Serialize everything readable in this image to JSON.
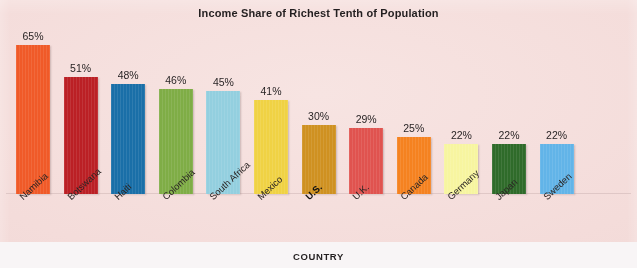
{
  "chart_data": {
    "type": "bar",
    "title": "Income Share of Richest Tenth of Population",
    "xlabel": "COUNTRY",
    "ylabel": "",
    "ylim": [
      0,
      70
    ],
    "grid": false,
    "legend": "none",
    "categories": [
      "Namibia",
      "Botswana",
      "Haiti",
      "Colombia",
      "South Africa",
      "Mexico",
      "U.S.",
      "U.K.",
      "Canada",
      "Germany",
      "Japan",
      "Sweden"
    ],
    "values": [
      65,
      51,
      48,
      46,
      45,
      41,
      30,
      29,
      25,
      22,
      22,
      22
    ],
    "value_labels": [
      "65%",
      "51%",
      "48%",
      "46%",
      "45%",
      "41%",
      "30%",
      "29%",
      "25%",
      "22%",
      "22%",
      "22%"
    ],
    "bar_colors": [
      "#f05a28",
      "#bb2025",
      "#1a6fa8",
      "#7fad46",
      "#93cfdf",
      "#f0d244",
      "#cf9121",
      "#e0534f",
      "#f58220",
      "#f7f5a0",
      "#2f6b2a",
      "#62b4e8"
    ],
    "highlight_category": "U.S.",
    "background_color": "#f4dcda"
  },
  "chart": {
    "title": "Income Share of Richest Tenth of Population",
    "axis_title": "COUNTRY"
  }
}
